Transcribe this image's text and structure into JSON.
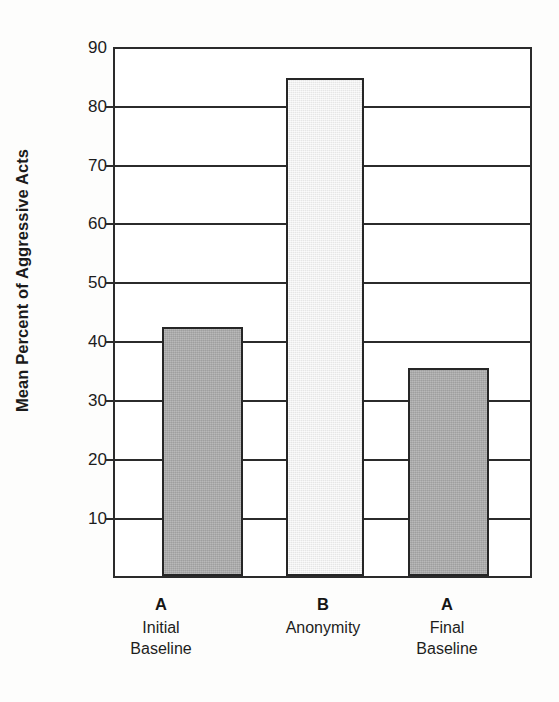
{
  "chart_data": {
    "type": "bar",
    "title": "",
    "xlabel": "",
    "ylabel": "Mean Percent of Aggressive Acts",
    "ylim": [
      0,
      90
    ],
    "ytick_labels": [
      "90",
      "80",
      "70",
      "60",
      "50",
      "40",
      "30",
      "20",
      "10"
    ],
    "ytick_values": [
      90,
      80,
      70,
      60,
      50,
      40,
      30,
      20,
      10
    ],
    "grid": "horizontal",
    "legend": "none",
    "categories": [
      "A\nInitial Baseline",
      "B\nAnonymity",
      "A\nFinal Baseline"
    ],
    "values": [
      42.5,
      85,
      35.5
    ],
    "bars": [
      {
        "code": "A",
        "condition_line1": "Initial",
        "condition_line2": "Baseline",
        "value": 42.5,
        "fill": "#a9a9a9",
        "style": "dark"
      },
      {
        "code": "B",
        "condition_line1": "Anonymity",
        "condition_line2": "",
        "value": 85,
        "fill": "#eeeeee",
        "style": "light"
      },
      {
        "code": "A",
        "condition_line1": "Final",
        "condition_line2": "Baseline",
        "value": 35.5,
        "fill": "#a9a9a9",
        "style": "dark"
      }
    ]
  },
  "colors": {
    "axis": "#2b2b2b",
    "bar_dark": "#a9a9a9",
    "bar_light": "#eeeeee",
    "text": "#1c1c1c",
    "background": "#fdfdfc"
  }
}
